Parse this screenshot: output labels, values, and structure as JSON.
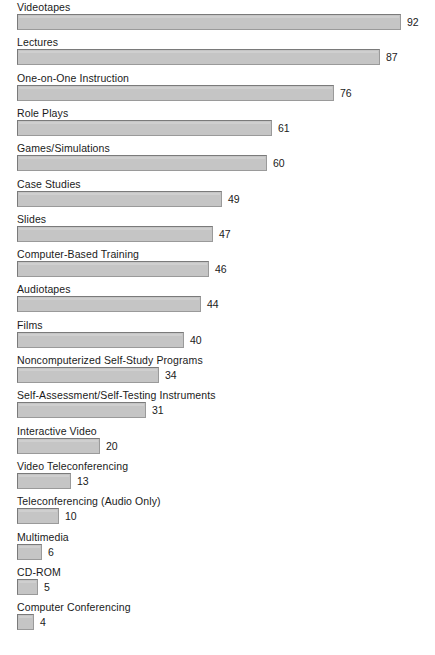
{
  "chart_data": {
    "type": "bar",
    "orientation": "horizontal",
    "title": "",
    "subtitle": "",
    "xlabel": "",
    "ylabel": "",
    "xlim": [
      0,
      92
    ],
    "grid": false,
    "legend": null,
    "value_labels": true,
    "bar_fill_color": "#c5c5c5",
    "bar_border_color": "#7a7a7a",
    "background_color": "#ffffff",
    "text_color": "#1a1a1a",
    "categories": [
      "Videotapes",
      "Lectures",
      "One-on-One Instruction",
      "Role Plays",
      "Games/Simulations",
      "Case Studies",
      "Slides",
      "Computer-Based Training",
      "Audiotapes",
      "Films",
      "Noncomputerized Self-Study Programs",
      "Self-Assessment/Self-Testing Instruments",
      "Interactive Video",
      "Video Teleconferencing",
      "Teleconferencing (Audio Only)",
      "Multimedia",
      "CD-ROM",
      "Computer Conferencing"
    ],
    "values": [
      92,
      87,
      76,
      61,
      60,
      49,
      47,
      46,
      44,
      40,
      34,
      31,
      20,
      13,
      10,
      6,
      5,
      4
    ],
    "value_text": [
      "92",
      "87",
      "76",
      "61",
      "60",
      "49",
      "47",
      "46",
      "44",
      "40",
      "34",
      "31",
      "20",
      "13",
      "10",
      "6",
      "5",
      "4"
    ]
  }
}
